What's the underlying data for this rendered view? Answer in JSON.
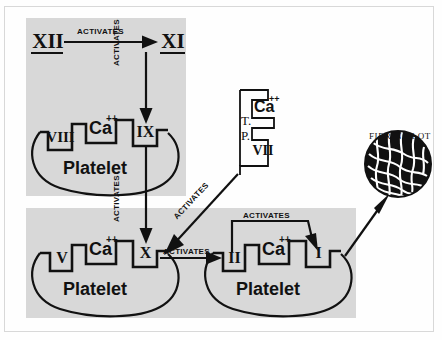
{
  "diagram": {
    "title_text": "FIBRIN CLOT",
    "background_color": "#fefefe",
    "panel_color": "#d8d8d8",
    "ink_color": "#111111",
    "activates_label": "ACTIVATES",
    "platelet_label": "Platelet",
    "calcium_label": "Ca",
    "calcium_superscript": "++",
    "tissue_factor_label_line1": "T.",
    "tissue_factor_label_line2": "P."
  },
  "factors": {
    "xii": "XII",
    "xi": "XI",
    "viii": "VIII",
    "ix": "IX",
    "v": "V",
    "x": "X",
    "vii": "VII",
    "ii": "II",
    "i": "I"
  },
  "platelets": [
    {
      "name": "upper-platelet",
      "label": "Platelet",
      "receptors": [
        "VIII",
        "Ca",
        "IX"
      ]
    },
    {
      "name": "lower-left-platelet",
      "label": "Platelet",
      "receptors": [
        "V",
        "Ca",
        "X"
      ]
    },
    {
      "name": "lower-right-platelet",
      "label": "Platelet",
      "receptors": [
        "II",
        "Ca",
        "I"
      ]
    }
  ],
  "tissue_complex": {
    "name": "tissue-thromboplastin-complex",
    "label": "T.P.",
    "receptors": [
      "Ca",
      "VII"
    ]
  },
  "arrows": [
    {
      "name": "arrow-xii-to-xi",
      "label": "ACTIVATES",
      "orientation": "horizontal"
    },
    {
      "name": "arrow-xi-to-ix",
      "label": "ACTIVATES",
      "orientation": "vertical"
    },
    {
      "name": "arrow-ix-to-x",
      "label": "ACTIVATES",
      "orientation": "vertical"
    },
    {
      "name": "arrow-tp-to-x",
      "label": "ACTIVATES",
      "orientation": "diagonal"
    },
    {
      "name": "arrow-x-to-ii",
      "label": "ACTIVATES",
      "orientation": "horizontal"
    },
    {
      "name": "arrow-ii-to-i",
      "label": "ACTIVATES",
      "orientation": "arc"
    },
    {
      "name": "arrow-i-to-fibrin-clot",
      "label": "",
      "orientation": "diagonal"
    }
  ],
  "fibrin_clot": {
    "name": "fibrin-clot",
    "label": "FIBRIN CLOT"
  }
}
